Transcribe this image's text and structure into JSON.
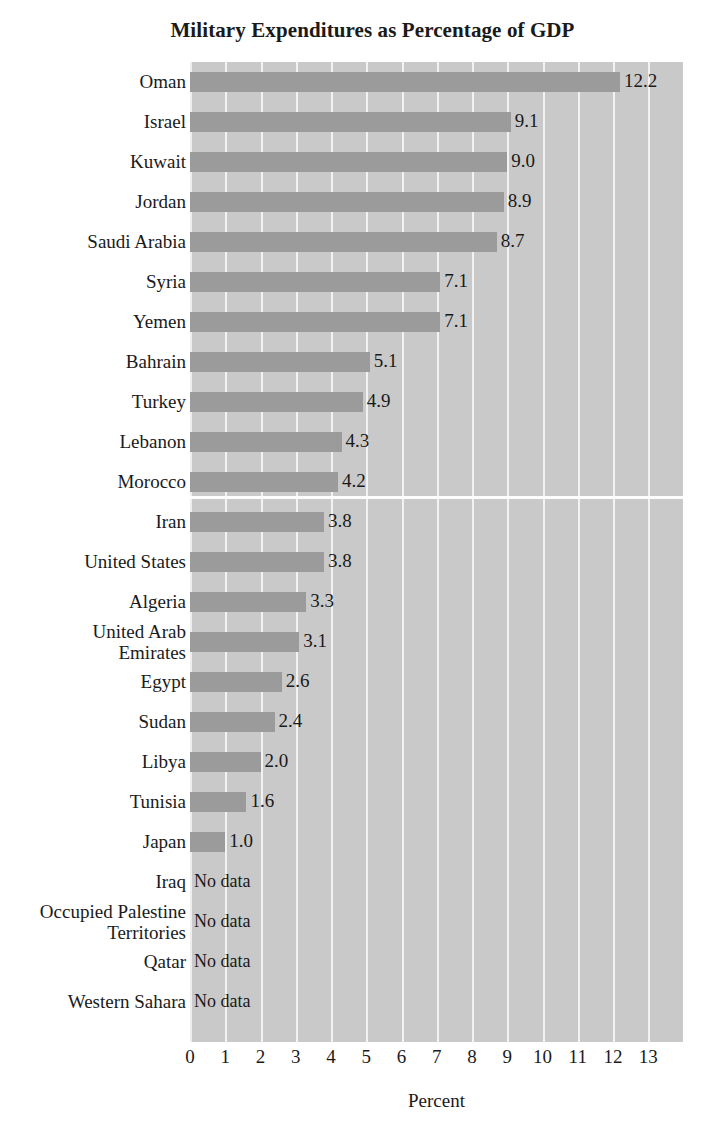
{
  "chart_data": {
    "type": "bar",
    "orientation": "horizontal",
    "title": "Military Expenditures as Percentage of GDP",
    "xlabel": "Percent",
    "ylabel": "",
    "xlim": [
      0,
      13
    ],
    "xticks": [
      "0",
      "1",
      "2",
      "3",
      "4",
      "5",
      "6",
      "7",
      "8",
      "9",
      "10",
      "11",
      "12",
      "13"
    ],
    "grid": "vertical",
    "legend": "none",
    "no_data_text": "No data",
    "group_separator_after": "Morocco",
    "bar_color": "#9b9b9b",
    "plot_background": "#c9c9c9",
    "gridline_color": "#f2f2f2",
    "categories": [
      "Oman",
      "Israel",
      "Kuwait",
      "Jordan",
      "Saudi Arabia",
      "Syria",
      "Yemen",
      "Bahrain",
      "Turkey",
      "Lebanon",
      "Morocco",
      "Iran",
      "United States",
      "Algeria",
      "United Arab\nEmirates",
      "Egypt",
      "Sudan",
      "Libya",
      "Tunisia",
      "Japan",
      "Iraq",
      "Occupied Palestine\nTerritories",
      "Qatar",
      "Western Sahara"
    ],
    "values": [
      12.2,
      9.1,
      9.0,
      8.9,
      8.7,
      7.1,
      7.1,
      5.1,
      4.9,
      4.3,
      4.2,
      3.8,
      3.8,
      3.3,
      3.1,
      2.6,
      2.4,
      2.0,
      1.6,
      1.0,
      null,
      null,
      null,
      null
    ],
    "value_labels": [
      "12.2",
      "9.1",
      "9.0",
      "8.9",
      "8.7",
      "7.1",
      "7.1",
      "5.1",
      "4.9",
      "4.3",
      "4.2",
      "3.8",
      "3.8",
      "3.3",
      "3.1",
      "2.6",
      "2.4",
      "2.0",
      "1.6",
      "1.0",
      "No data",
      "No data",
      "No data",
      "No data"
    ]
  }
}
